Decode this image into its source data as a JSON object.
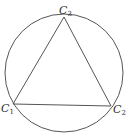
{
  "diagram": {
    "circle": {
      "cx": 64,
      "cy": 73,
      "r": 59
    },
    "points": [
      {
        "name": "C",
        "sub": "1",
        "x": 13,
        "y": 104
      },
      {
        "name": "C",
        "sub": "2",
        "x": 111,
        "y": 106
      },
      {
        "name": "C",
        "sub": "3",
        "x": 64,
        "y": 17
      }
    ],
    "stroke_color": "#555555"
  }
}
